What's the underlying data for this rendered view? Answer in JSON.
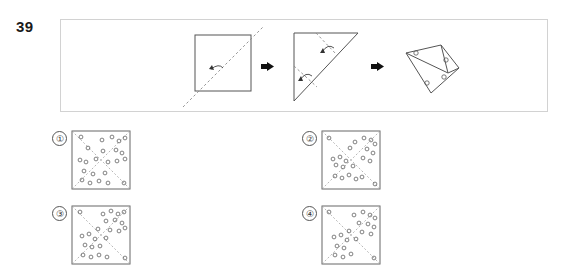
{
  "question": {
    "number": "39",
    "type": "paper-folding-punch"
  },
  "stem": {
    "panel_border_color": "#d2d2d2",
    "arrow_glyph": "right-arrow",
    "steps": [
      {
        "index": 1,
        "name": "square-with-diagonal-fold",
        "shape": "square",
        "fold_lines": [
          {
            "kind": "dashed",
            "from": [
              6,
              74
            ],
            "to": [
              74,
              6
            ],
            "note": "bottom-left to top-right diagonal, extends past square"
          }
        ],
        "fold_arrows": [
          {
            "kind": "curved",
            "at": [
              36,
              40
            ],
            "direction": "up-left"
          }
        ],
        "square": {
          "x": 14,
          "y": 10,
          "w": 56,
          "h": 56
        }
      },
      {
        "index": 2,
        "name": "triangle-with-two-folds",
        "shape": "right-triangle",
        "triangle": [
          [
            8,
            8
          ],
          [
            70,
            8
          ],
          [
            8,
            74
          ]
        ],
        "fold_lines": [
          {
            "kind": "dashed",
            "from": [
              30,
              8
            ],
            "to": [
              48,
              30
            ],
            "note": "top fold"
          },
          {
            "kind": "dashed",
            "from": [
              8,
              40
            ],
            "to": [
              30,
              60
            ],
            "note": "left fold"
          }
        ],
        "fold_arrows": [
          {
            "kind": "curved",
            "at": [
              40,
              22
            ],
            "direction": "up-right"
          },
          {
            "kind": "curved",
            "at": [
              18,
              48
            ],
            "direction": "down-left"
          }
        ]
      },
      {
        "index": 3,
        "name": "folded-shape-with-punches",
        "shape": "folded-polygon",
        "punch_count": 4,
        "punches": [
          [
            16,
            19
          ],
          [
            46,
            30
          ],
          [
            27,
            52
          ],
          [
            44,
            48
          ]
        ]
      }
    ]
  },
  "options": [
    {
      "id": 1,
      "marker": "①",
      "name": "option-1",
      "fold_creases": "diagonals",
      "hole_count": 23,
      "holes": [
        [
          9,
          6
        ],
        [
          30,
          9
        ],
        [
          40,
          6
        ],
        [
          47,
          10
        ],
        [
          53,
          7
        ],
        [
          16,
          17
        ],
        [
          31,
          20
        ],
        [
          44,
          19
        ],
        [
          50,
          22
        ],
        [
          8,
          29
        ],
        [
          14,
          31
        ],
        [
          24,
          28
        ],
        [
          36,
          31
        ],
        [
          45,
          30
        ],
        [
          53,
          28
        ],
        [
          12,
          40
        ],
        [
          21,
          43
        ],
        [
          33,
          42
        ],
        [
          10,
          49
        ],
        [
          18,
          52
        ],
        [
          27,
          50
        ],
        [
          36,
          52
        ],
        [
          52,
          52
        ]
      ]
    },
    {
      "id": 2,
      "marker": "②",
      "name": "option-2",
      "fold_creases": "diagonals",
      "hole_count": 22,
      "holes": [
        [
          7,
          7
        ],
        [
          33,
          11
        ],
        [
          42,
          7
        ],
        [
          49,
          9
        ],
        [
          53,
          13
        ],
        [
          28,
          17
        ],
        [
          45,
          18
        ],
        [
          51,
          22
        ],
        [
          11,
          28
        ],
        [
          18,
          26
        ],
        [
          24,
          30
        ],
        [
          41,
          27
        ],
        [
          48,
          30
        ],
        [
          14,
          34
        ],
        [
          21,
          36
        ],
        [
          31,
          35
        ],
        [
          13,
          45
        ],
        [
          20,
          47
        ],
        [
          27,
          44
        ],
        [
          34,
          48
        ],
        [
          40,
          46
        ],
        [
          53,
          53
        ]
      ]
    },
    {
      "id": 3,
      "marker": "③",
      "name": "option-3",
      "fold_creases": "diagonals",
      "hole_count": 24,
      "holes": [
        [
          8,
          6
        ],
        [
          31,
          8
        ],
        [
          39,
          5
        ],
        [
          46,
          8
        ],
        [
          52,
          6
        ],
        [
          34,
          15
        ],
        [
          43,
          14
        ],
        [
          50,
          17
        ],
        [
          26,
          23
        ],
        [
          38,
          24
        ],
        [
          47,
          25
        ],
        [
          53,
          22
        ],
        [
          10,
          30
        ],
        [
          17,
          28
        ],
        [
          23,
          33
        ],
        [
          34,
          32
        ],
        [
          13,
          39
        ],
        [
          20,
          41
        ],
        [
          28,
          40
        ],
        [
          11,
          49
        ],
        [
          19,
          51
        ],
        [
          27,
          49
        ],
        [
          35,
          51
        ],
        [
          53,
          52
        ]
      ]
    },
    {
      "id": 4,
      "marker": "④",
      "name": "option-4",
      "fold_creases": "diagonals",
      "hole_count": 21,
      "holes": [
        [
          7,
          6
        ],
        [
          32,
          9
        ],
        [
          41,
          6
        ],
        [
          48,
          9
        ],
        [
          53,
          12
        ],
        [
          37,
          17
        ],
        [
          46,
          18
        ],
        [
          52,
          21
        ],
        [
          27,
          25
        ],
        [
          40,
          26
        ],
        [
          49,
          28
        ],
        [
          12,
          31
        ],
        [
          19,
          29
        ],
        [
          25,
          34
        ],
        [
          34,
          33
        ],
        [
          15,
          40
        ],
        [
          22,
          42
        ],
        [
          13,
          49
        ],
        [
          21,
          51
        ],
        [
          29,
          48
        ],
        [
          52,
          52
        ]
      ]
    }
  ]
}
